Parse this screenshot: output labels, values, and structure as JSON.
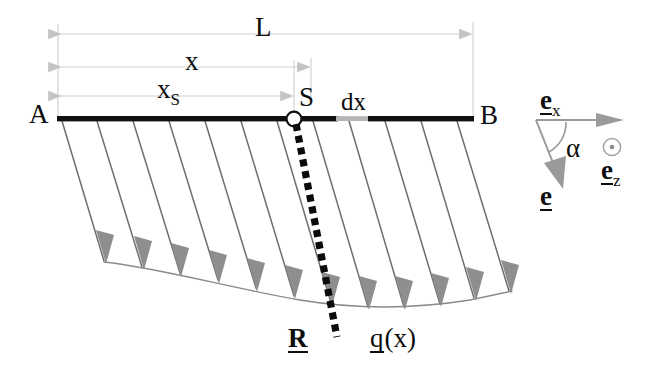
{
  "figure": {
    "kind": "engineering-beam-load-diagram",
    "background_color": "#ffffff",
    "ink_color": "#0d0d0d",
    "load_line_color": "#6e6e6e",
    "load_head_color": "#8f8f8f",
    "dimension_color": "#c9c9c9",
    "dx_segment_color": "#b5b5b5"
  },
  "beam": {
    "left_label": "A",
    "right_label": "B",
    "node_label": "S",
    "element_label": "dx"
  },
  "dimensions": [
    {
      "name": "total-length",
      "label": "L"
    },
    {
      "name": "distance-x",
      "label": "x"
    },
    {
      "name": "distance-xs",
      "label": "x",
      "subscript": "S"
    }
  ],
  "annotations": {
    "resultant": "R",
    "load_function": "q",
    "load_argument": "(x)"
  },
  "legend": {
    "unit_vector_x": "e",
    "unit_vector_x_sub": "x",
    "unit_vector_z": "e",
    "unit_vector_z_sub": "z",
    "unit_vector_e": "e",
    "angle": "α",
    "out_of_plane_icon": "circle-dot-icon"
  }
}
